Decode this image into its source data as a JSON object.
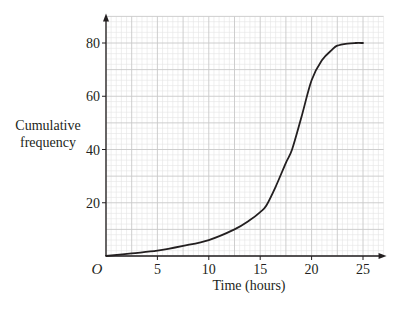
{
  "chart_data": {
    "type": "line",
    "title": "",
    "xlabel": "Time (hours)",
    "ylabel": "Cumulative frequency",
    "ylabel_lines": [
      "Cumulative",
      "frequency"
    ],
    "origin_label": "O",
    "xlim": [
      0,
      27
    ],
    "ylim": [
      0,
      90
    ],
    "xticks": [
      5,
      10,
      15,
      20,
      25
    ],
    "yticks": [
      20,
      40,
      60,
      80
    ],
    "grid": {
      "on": true,
      "x_major": 2.5,
      "x_minor": 0.5,
      "y_major": 10,
      "y_minor": 2
    },
    "series": [
      {
        "name": "Cumulative frequency curve",
        "x": [
          0,
          2.5,
          5,
          7.5,
          10,
          12.5,
          14,
          15,
          15.6,
          16.5,
          17.5,
          18.1,
          19,
          20,
          21,
          22,
          22.5,
          23.5,
          24.3,
          25
        ],
        "y": [
          0,
          1,
          2,
          3.8,
          6,
          10,
          13.5,
          16.5,
          19,
          26,
          35,
          40,
          52,
          66,
          73.5,
          77.5,
          79,
          79.8,
          80,
          80
        ]
      }
    ],
    "colors": {
      "curve": "#231f20",
      "axis": "#231f20",
      "grid_major": "#c8c8c8",
      "grid_minor": "#e4e4e4"
    }
  }
}
